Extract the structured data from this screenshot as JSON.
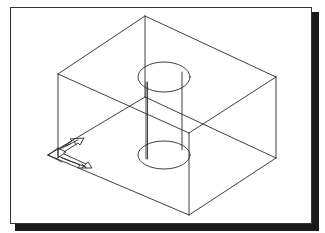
{
  "figure": {
    "line_color": "#2a2a2a",
    "frame_color": "#333333",
    "shadow_color": "#1a1a1a",
    "background": "#ffffff"
  },
  "box": {
    "top_face": [
      [
        145,
        16
      ],
      [
        276,
        77
      ],
      [
        189,
        133
      ],
      [
        58,
        74
      ]
    ],
    "bottom_face": [
      [
        146,
        97
      ],
      [
        276,
        158
      ],
      [
        189,
        215
      ],
      [
        48,
        155
      ]
    ],
    "verticals": [
      [
        [
          145,
          16
        ],
        [
          146,
          97
        ]
      ],
      [
        [
          276,
          77
        ],
        [
          276,
          158
        ]
      ],
      [
        [
          189,
          133
        ],
        [
          189,
          215
        ]
      ],
      [
        [
          58,
          74
        ],
        [
          58,
          155
        ]
      ]
    ]
  },
  "cylinder": {
    "top_ellipse": {
      "cx": 164,
      "cy": 77,
      "rx": 26,
      "ry": 15
    },
    "bottom_ellipse": {
      "cx": 164,
      "cy": 155,
      "rx": 26,
      "ry": 14
    },
    "left_x": 146,
    "right_x": 183
  },
  "ucs_icon": {
    "label": "UCS icon",
    "origin": [
      58,
      155
    ]
  }
}
